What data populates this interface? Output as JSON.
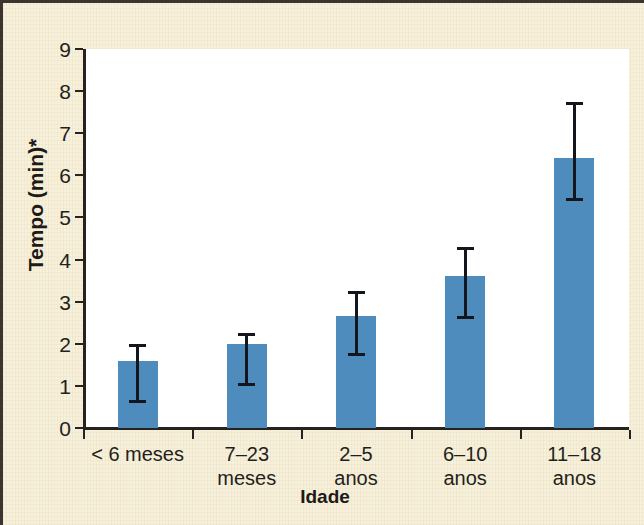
{
  "chart_data": {
    "type": "bar",
    "title": "",
    "xlabel": "Idade",
    "ylabel": "Tempo (min)*",
    "categories": [
      "< 6 meses",
      "7–23\nmeses",
      "2–5\nanos",
      "6–10\nanos",
      "11–18\nanos"
    ],
    "category_labels_flat": [
      "< 6 meses",
      "7–23 meses",
      "2–5 anos",
      "6–10 anos",
      "11–18 anos"
    ],
    "values": [
      1.6,
      2.0,
      2.65,
      3.6,
      6.4
    ],
    "error_upper": [
      2.0,
      2.25,
      3.25,
      4.3,
      7.75
    ],
    "error_lower": [
      0.6,
      1.0,
      1.7,
      2.6,
      5.4
    ],
    "ylim": [
      0,
      9
    ],
    "yticks": [
      0,
      1,
      2,
      3,
      4,
      5,
      6,
      7,
      8,
      9
    ],
    "ytick_labels": [
      "0",
      "1",
      "2",
      "3",
      "4",
      "5",
      "6",
      "7",
      "8",
      "9"
    ],
    "grid": false,
    "legend": false,
    "bar_color": "#4f8cbe",
    "error_color": "#14161e",
    "axis_color": "#262220",
    "background_color": "#f7f0da",
    "plot_background_color": "#ffffff"
  }
}
